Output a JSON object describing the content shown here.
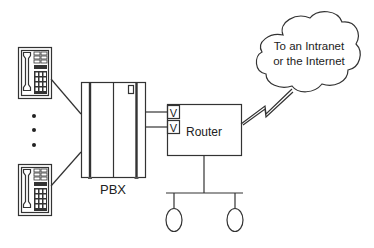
{
  "diagram": {
    "type": "network-topology",
    "nodes": {
      "phone_top": {
        "label": "",
        "icon": "desk-phone-icon"
      },
      "ellipsis": {
        "label": "•••",
        "meaning": "more phones"
      },
      "phone_bottom": {
        "label": "",
        "icon": "desk-phone-icon"
      },
      "pbx": {
        "label": "PBX"
      },
      "voice_port_1": {
        "label": "V"
      },
      "voice_port_2": {
        "label": "V"
      },
      "router": {
        "label": "Router"
      },
      "cloud": {
        "line1": "To an Intranet",
        "line2": "or the Internet"
      },
      "lan_host_1": {
        "label": ""
      },
      "lan_host_2": {
        "label": ""
      }
    },
    "edges": [
      {
        "from": "phone_top",
        "to": "pbx"
      },
      {
        "from": "phone_bottom",
        "to": "pbx"
      },
      {
        "from": "pbx",
        "to": "voice_port_1"
      },
      {
        "from": "pbx",
        "to": "voice_port_2"
      },
      {
        "from": "router",
        "to": "cloud",
        "style": "lightning (WAN link)"
      },
      {
        "from": "router",
        "to": "lan_bus"
      },
      {
        "from": "lan_bus",
        "to": "lan_host_1"
      },
      {
        "from": "lan_bus",
        "to": "lan_host_2"
      }
    ],
    "colors": {
      "stroke": "#333333",
      "background": "#ffffff"
    }
  }
}
